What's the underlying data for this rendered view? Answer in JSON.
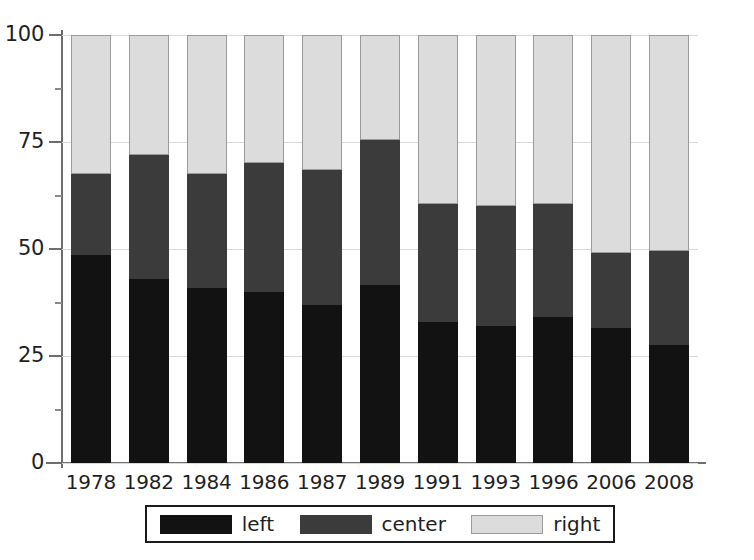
{
  "chart_data": {
    "type": "bar",
    "subtype": "stacked-100-percent",
    "title": "",
    "subtitle": "",
    "xlabel": "",
    "ylabel": "",
    "categories": [
      "1978",
      "1982",
      "1984",
      "1986",
      "1987",
      "1989",
      "1991",
      "1993",
      "1996",
      "2006",
      "2008"
    ],
    "series": [
      {
        "name": "left",
        "color": "#121212",
        "values": [
          48.5,
          43.0,
          41.0,
          40.0,
          37.0,
          41.5,
          33.0,
          32.0,
          34.0,
          31.5,
          27.5
        ]
      },
      {
        "name": "center",
        "color": "#3b3b3b",
        "values": [
          19.0,
          29.0,
          26.5,
          30.0,
          31.5,
          34.0,
          27.5,
          28.0,
          26.5,
          17.5,
          22.0
        ]
      },
      {
        "name": "right",
        "color": "#dcdcdc",
        "values": [
          32.5,
          28.0,
          32.5,
          30.0,
          31.5,
          24.5,
          39.5,
          40.0,
          39.5,
          51.0,
          50.5
        ]
      }
    ],
    "cumulative_tops": {
      "left": [
        48.5,
        43.0,
        41.0,
        40.0,
        37.0,
        41.5,
        33.0,
        32.0,
        34.0,
        31.5,
        27.5
      ],
      "center": [
        67.5,
        72.0,
        67.5,
        70.0,
        68.5,
        75.5,
        60.5,
        60.0,
        60.5,
        49.0,
        49.5
      ],
      "right": [
        100,
        100,
        100,
        100,
        100,
        100,
        100,
        100,
        100,
        100,
        100
      ]
    },
    "ylim": [
      0,
      100
    ],
    "yticks": [
      0,
      25,
      50,
      75,
      100
    ],
    "yticklabels": [
      "0",
      "25",
      "50",
      "75",
      "100"
    ],
    "yminorticks": [
      12.5,
      37.5,
      62.5,
      87.5
    ],
    "grid": true,
    "legend": {
      "position": "bottom",
      "entries": [
        {
          "label": "left",
          "color": "#121212"
        },
        {
          "label": "center",
          "color": "#3b3b3b"
        },
        {
          "label": "right",
          "color": "#dcdcdc"
        }
      ]
    }
  },
  "axis": {
    "y_tick_labels": [
      "100",
      "75",
      "50",
      "25",
      "0"
    ],
    "x_tick_labels": [
      "1978",
      "1982",
      "1984",
      "1986",
      "1987",
      "1989",
      "1991",
      "1993",
      "1996",
      "2006",
      "2008"
    ]
  },
  "colors": {
    "left": "#121212",
    "center": "#3b3b3b",
    "right": "#dcdcdc",
    "axis": "#6e6e6e",
    "grid": "#d9d9d9",
    "text": "#1f1f1f",
    "background": "#ffffff"
  }
}
